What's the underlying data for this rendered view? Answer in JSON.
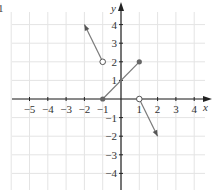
{
  "figure": {
    "corner_label": "1"
  },
  "chart_data": {
    "type": "line",
    "title": "",
    "xlabel": "x",
    "ylabel": "y",
    "xlim": [
      -5.8,
      4.9
    ],
    "ylim": [
      -4.9,
      5.1
    ],
    "grid": true,
    "x_ticks": [
      -5,
      -4,
      -3,
      -2,
      -1,
      1,
      2,
      3,
      4
    ],
    "y_ticks": [
      -4,
      -3,
      -2,
      -1,
      1,
      2,
      3,
      4
    ],
    "x_tick_labels": [
      "−5",
      "−4",
      "−3",
      "−2",
      "−1",
      "1",
      "2",
      "3",
      "4"
    ],
    "y_tick_labels": [
      "−4",
      "−3",
      "−2",
      "−1",
      "1",
      "2",
      "3",
      "4"
    ],
    "series": [
      {
        "name": "left ray",
        "points": [
          [
            -1,
            2
          ],
          [
            -2,
            4
          ]
        ],
        "start": "open",
        "end": "arrow"
      },
      {
        "name": "middle segment",
        "points": [
          [
            -1,
            0
          ],
          [
            1,
            2
          ]
        ],
        "start": "closed",
        "end": "closed"
      },
      {
        "name": "right ray",
        "points": [
          [
            1,
            0
          ],
          [
            2,
            -2
          ]
        ],
        "start": "open",
        "end": "arrow"
      }
    ],
    "colors": {
      "line": "#7a7a7a",
      "axis": "#222222",
      "grid": "#e4e4e4"
    }
  }
}
